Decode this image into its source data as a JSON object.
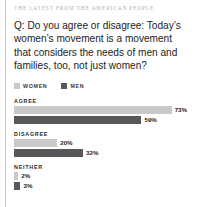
{
  "kicker": "THE LATEST FROM THE AMERICAN PEOPLE",
  "question": "Q: Do you agree or disagree: Today’s women’s movement is a movement that considers the needs of men and families, too, not just women?",
  "legend": {
    "women_label": "WOMEN",
    "men_label": "MEN",
    "women_color": "#c9c9c9",
    "men_color": "#58585a"
  },
  "chart_data": {
    "type": "bar",
    "title": "Q: Do you agree or disagree: Today’s women’s movement is a movement that considers the needs of men and families, too, not just women?",
    "orientation": "horizontal",
    "categories": [
      "AGREE",
      "DISAGREE",
      "NEITHER"
    ],
    "series": [
      {
        "name": "WOMEN",
        "color": "#c9c9c9",
        "values": [
          73,
          20,
          2
        ],
        "labels": [
          "73%",
          "20%",
          "2%"
        ]
      },
      {
        "name": "MEN",
        "color": "#58585a",
        "values": [
          59,
          32,
          3
        ],
        "labels": [
          "59%",
          "32%",
          "3%"
        ]
      }
    ],
    "xlabel": "",
    "ylabel": "",
    "xlim": [
      0,
      100
    ],
    "unit": "%",
    "grid": false,
    "legend_position": "top-left"
  },
  "groups": [
    {
      "label": "AGREE",
      "women": {
        "value": 73,
        "label": "73%"
      },
      "men": {
        "value": 59,
        "label": "59%"
      }
    },
    {
      "label": "DISAGREE",
      "women": {
        "value": 20,
        "label": "20%"
      },
      "men": {
        "value": 32,
        "label": "32%"
      }
    },
    {
      "label": "NEITHER",
      "women": {
        "value": 2,
        "label": "2%"
      },
      "men": {
        "value": 3,
        "label": "3%"
      }
    }
  ]
}
